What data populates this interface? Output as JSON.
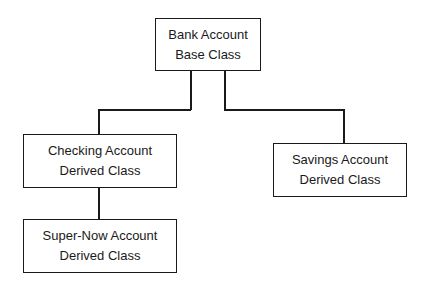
{
  "diagram": {
    "type": "class-hierarchy",
    "nodes": [
      {
        "id": "bank",
        "line1": "Bank Account",
        "line2": "Base Class"
      },
      {
        "id": "checking",
        "line1": "Checking Account",
        "line2": "Derived Class"
      },
      {
        "id": "savings",
        "line1": "Savings Account",
        "line2": "Derived Class"
      },
      {
        "id": "supernow",
        "line1": "Super-Now Account",
        "line2": "Derived Class"
      }
    ],
    "edges": [
      {
        "from": "bank",
        "to": "checking"
      },
      {
        "from": "bank",
        "to": "savings"
      },
      {
        "from": "checking",
        "to": "supernow"
      }
    ]
  }
}
